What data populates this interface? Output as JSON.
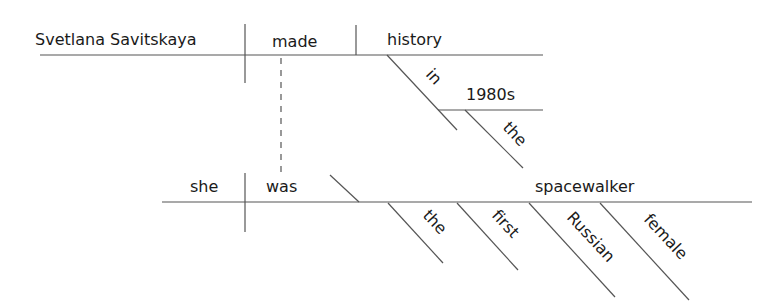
{
  "diagram": {
    "type": "reed-kellogg sentence diagram",
    "clauses": {
      "main": {
        "subject": "Svetlana Savitskaya",
        "verb": "made",
        "direct_object": "history",
        "prepositional_phrase": {
          "preposition": "in",
          "object": "1980s",
          "modifier": "the"
        }
      },
      "relative": {
        "subject": "she",
        "verb": "was",
        "predicate_nominative": "spacewalker",
        "modifiers": [
          "the",
          "first",
          "Russian",
          "female"
        ]
      }
    },
    "colors": {
      "text": "#1a1a1a",
      "line": "#555555",
      "background": "#ffffff"
    }
  }
}
